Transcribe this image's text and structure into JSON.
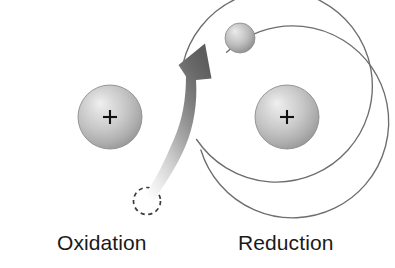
{
  "figure": {
    "background_color": "#ffffff"
  },
  "labels": {
    "left": "Oxidation",
    "right": "Reduction"
  },
  "colors": {
    "orbit_stroke": "#6e6e6e",
    "nucleus_light": "#f2f2f2",
    "nucleus_mid": "#c6c6c6",
    "nucleus_dark": "#9a9a9a",
    "nucleus_edge": "#8a8a8a",
    "plus_sign": "#111111",
    "electron_light": "#efefef",
    "electron_mid": "#b9b9b9",
    "electron_dark": "#8e8e8e",
    "dashed_circle_stroke": "#333333",
    "arrow_dark": "#5f5f5f",
    "arrow_light": "#f3f3f3",
    "text": "#1a1a1a"
  },
  "left_atom": {
    "name": "Oxidation atom",
    "orbit": {
      "cx": 112,
      "cy": 111,
      "r": 96
    },
    "nucleus": {
      "cx": 110,
      "cy": 117,
      "r": 32,
      "charge": "+"
    },
    "electron_vacancy": {
      "cx": 147,
      "cy": 201,
      "r": 14,
      "style": "dashed"
    }
  },
  "right_atom": {
    "name": "Reduction atom",
    "orbit": {
      "cx": 285,
      "cy": 111,
      "r": 96
    },
    "nucleus": {
      "cx": 287,
      "cy": 117,
      "r": 32,
      "charge": "+"
    },
    "electron": {
      "cx": 240,
      "cy": 38,
      "r": 15,
      "style": "solid"
    }
  },
  "transfer_arrow": {
    "name": "electron-transfer-arrow",
    "from": "electron_vacancy",
    "to": "electron",
    "direction": "left-bottom to right-top",
    "gradient": "light-to-dark"
  }
}
